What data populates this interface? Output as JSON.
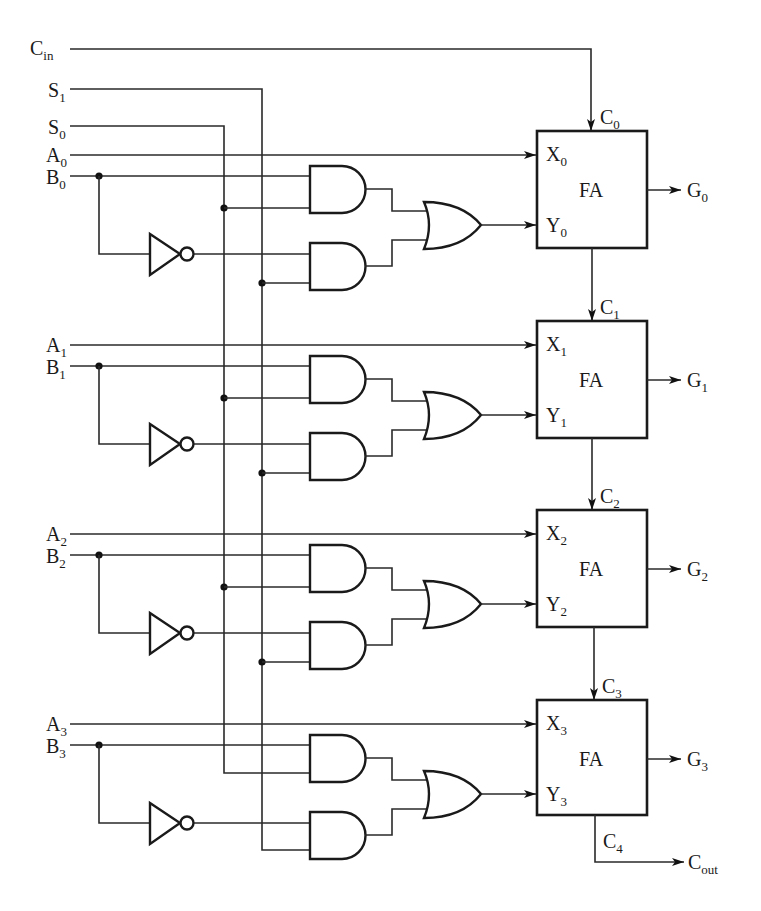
{
  "diagram": {
    "inputs": {
      "cin": {
        "main": "C",
        "sub": "in"
      },
      "s1": {
        "main": "S",
        "sub": "1"
      },
      "s0": {
        "main": "S",
        "sub": "0"
      }
    },
    "stages": [
      {
        "a": {
          "main": "A",
          "sub": "0"
        },
        "b": {
          "main": "B",
          "sub": "0"
        },
        "x": {
          "main": "X",
          "sub": "0"
        },
        "y": {
          "main": "Y",
          "sub": "0"
        },
        "fa": "FA",
        "g": {
          "main": "G",
          "sub": "0"
        },
        "cin": {
          "main": "C",
          "sub": "0"
        }
      },
      {
        "a": {
          "main": "A",
          "sub": "1"
        },
        "b": {
          "main": "B",
          "sub": "1"
        },
        "x": {
          "main": "X",
          "sub": "1"
        },
        "y": {
          "main": "Y",
          "sub": "1"
        },
        "fa": "FA",
        "g": {
          "main": "G",
          "sub": "1"
        },
        "cin": {
          "main": "C",
          "sub": "1"
        }
      },
      {
        "a": {
          "main": "A",
          "sub": "2"
        },
        "b": {
          "main": "B",
          "sub": "2"
        },
        "x": {
          "main": "X",
          "sub": "2"
        },
        "y": {
          "main": "Y",
          "sub": "2"
        },
        "fa": "FA",
        "g": {
          "main": "G",
          "sub": "2"
        },
        "cin": {
          "main": "C",
          "sub": "2"
        }
      },
      {
        "a": {
          "main": "A",
          "sub": "3"
        },
        "b": {
          "main": "B",
          "sub": "3"
        },
        "x": {
          "main": "X",
          "sub": "3"
        },
        "y": {
          "main": "Y",
          "sub": "3"
        },
        "fa": "FA",
        "g": {
          "main": "G",
          "sub": "3"
        },
        "cin": {
          "main": "C",
          "sub": "3"
        }
      }
    ],
    "carry_final": {
      "main": "C",
      "sub": "4"
    },
    "cout": {
      "main": "C",
      "sub": "out"
    },
    "components": {
      "full_adder_count": 4,
      "and_gate_count": 8,
      "or_gate_count": 4,
      "inverter_count": 4
    }
  }
}
